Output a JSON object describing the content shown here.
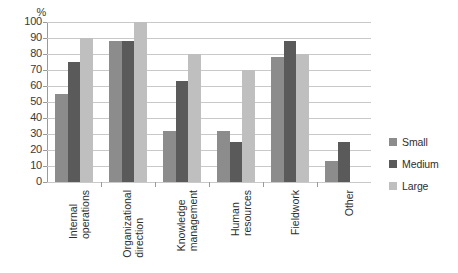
{
  "chart_data": {
    "type": "bar",
    "title": "",
    "subtitle": "",
    "xlabel": "",
    "ylabel": "%",
    "ylim": [
      0,
      100
    ],
    "y_ticks": [
      0,
      10,
      20,
      30,
      40,
      50,
      60,
      70,
      80,
      90,
      100
    ],
    "grid": true,
    "legend_position": "right",
    "orientation": "vertical",
    "grouping": "grouped",
    "categories": [
      "Internal\noperations",
      "Organizational\ndirection",
      "Knowledge\nmanagement",
      "Human\nresources",
      "Fieldwork",
      "Other"
    ],
    "series": [
      {
        "name": "Small",
        "color": "#8c8c8c",
        "values": [
          55,
          88,
          32,
          32,
          78,
          13
        ]
      },
      {
        "name": "Medium",
        "color": "#5a5a5a",
        "values": [
          75,
          88,
          63,
          25,
          88,
          25
        ]
      },
      {
        "name": "Large",
        "color": "#bfbfbf",
        "values": [
          90,
          100,
          80,
          70,
          80,
          null
        ]
      }
    ]
  },
  "axis": {
    "unit_label": "%",
    "tick_labels": [
      "100",
      "90",
      "80",
      "70",
      "60",
      "50",
      "40",
      "30",
      "20",
      "10",
      "0"
    ]
  },
  "legend": {
    "items": [
      {
        "label": "Small",
        "color": "#8c8c8c"
      },
      {
        "label": "Medium",
        "color": "#5a5a5a"
      },
      {
        "label": "Large",
        "color": "#bfbfbf"
      }
    ]
  },
  "colors": {
    "small": "#8c8c8c",
    "medium": "#5a5a5a",
    "large": "#bfbfbf",
    "gridline": "#c9c9c9",
    "axis": "#9a9a9a",
    "text": "#2e2e2e",
    "background": "#ffffff"
  }
}
